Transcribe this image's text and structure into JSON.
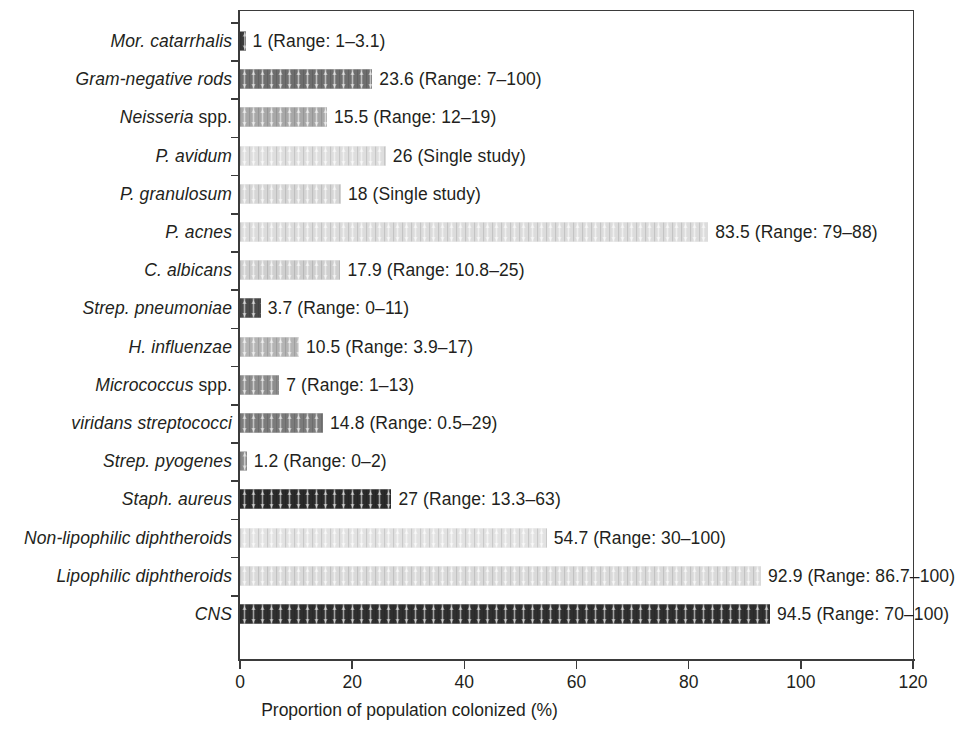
{
  "chart_data": {
    "type": "bar",
    "orientation": "horizontal",
    "title": "",
    "xlabel": "Proportion of population colonized (%)",
    "ylabel": "",
    "xlim": [
      0,
      120
    ],
    "xticks": [
      0,
      20,
      40,
      60,
      80,
      100,
      120
    ],
    "grid": false,
    "legend": "none",
    "categories": [
      "Mor. catarrhalis",
      "Gram-negative rods",
      "Neisseria spp.",
      "P. avidum",
      "P. granulosum",
      "P. acnes",
      "C. albicans",
      "Strep. pneumoniae",
      "H. influenzae",
      "Micrococcus spp.",
      "viridans streptococci",
      "Strep. pyogenes",
      "Staph. aureus",
      "Non-lipophilic diphtheroids",
      "Lipophilic diphtheroids",
      "CNS"
    ],
    "values": [
      1,
      23.6,
      15.5,
      26,
      18,
      83.5,
      17.9,
      3.7,
      10.5,
      7,
      14.8,
      1.2,
      27,
      54.7,
      92.9,
      94.5
    ],
    "annotations": [
      "1 (Range: 1–3.1)",
      "23.6 (Range: 7–100)",
      "15.5 (Range: 12–19)",
      "26 (Single study)",
      "18 (Single study)",
      "83.5 (Range: 79–88)",
      "17.9 (Range: 10.8–25)",
      "3.7 (Range: 0–11)",
      "10.5 (Range: 3.9–17)",
      "7 (Range: 1–13)",
      "14.8 (Range: 0.5–29)",
      "1.2 (Range: 0–2)",
      "27 (Range: 13.3–63)",
      "54.7 (Range: 30–100)",
      "92.9 (Range: 86.7–100)",
      "94.5 (Range: 70–100)"
    ]
  },
  "rows": [
    {
      "label_italic": "Mor. catarrhalis",
      "label_upright": "",
      "value": 1,
      "annotation": "1 (Range: 1–3.1)",
      "shade": "#3a3a3a"
    },
    {
      "label_italic": "Gram-negative rods",
      "label_upright": "",
      "value": 23.6,
      "annotation": "23.6 (Range: 7–100)",
      "shade": "#6e6e6e"
    },
    {
      "label_italic": "Neisseria",
      "label_upright": " spp.",
      "value": 15.5,
      "annotation": "15.5 (Range: 12–19)",
      "shade": "#a8a8a8"
    },
    {
      "label_italic": "P. avidum",
      "label_upright": "",
      "value": 26,
      "annotation": "26 (Single study)",
      "shade": "#dedede"
    },
    {
      "label_italic": "P. granulosum",
      "label_upright": "",
      "value": 18,
      "annotation": "18 (Single study)",
      "shade": "#d6d6d6"
    },
    {
      "label_italic": "P. acnes",
      "label_upright": "",
      "value": 83.5,
      "annotation": "83.5 (Range: 79–88)",
      "shade": "#dcdcdc"
    },
    {
      "label_italic": "C. albicans",
      "label_upright": "",
      "value": 17.9,
      "annotation": "17.9 (Range: 10.8–25)",
      "shade": "#cfcfcf"
    },
    {
      "label_italic": "Strep. pneumoniae",
      "label_upright": "",
      "value": 3.7,
      "annotation": "3.7 (Range: 0–11)",
      "shade": "#4a4a4a"
    },
    {
      "label_italic": "H. influenzae",
      "label_upright": "",
      "value": 10.5,
      "annotation": "10.5 (Range: 3.9–17)",
      "shade": "#b4b4b4"
    },
    {
      "label_italic": "Micrococcus",
      "label_upright": " spp.",
      "value": 7,
      "annotation": "7 (Range: 1–13)",
      "shade": "#8d8d8d"
    },
    {
      "label_italic": "viridans streptococci",
      "label_upright": "",
      "value": 14.8,
      "annotation": "14.8 (Range: 0.5–29)",
      "shade": "#7b7b7b"
    },
    {
      "label_italic": "Strep. pyogenes",
      "label_upright": "",
      "value": 1.2,
      "annotation": "1.2 (Range: 0–2)",
      "shade": "#8a8a8a"
    },
    {
      "label_italic": "Staph. aureus",
      "label_upright": "",
      "value": 27,
      "annotation": "27 (Range: 13.3–63)",
      "shade": "#2a2a2a"
    },
    {
      "label_italic": "Non-lipophilic diphtheroids",
      "label_upright": "",
      "value": 54.7,
      "annotation": "54.7 (Range: 30–100)",
      "shade": "#e2e2e2"
    },
    {
      "label_italic": "Lipophilic diphtheroids",
      "label_upright": "",
      "value": 92.9,
      "annotation": "92.9 (Range: 86.7–100)",
      "shade": "#dadada"
    },
    {
      "label_italic": "CNS",
      "label_upright": "",
      "value": 94.5,
      "annotation": "94.5 (Range: 70–100)",
      "shade": "#2f2f2f"
    }
  ],
  "axis": {
    "x_title": "Proportion of population colonized (%)",
    "ticks": [
      "0",
      "20",
      "40",
      "60",
      "80",
      "100",
      "120"
    ]
  },
  "colors": {
    "axis": "#3b3b3b",
    "text": "#231f20",
    "background": "#ffffff"
  }
}
